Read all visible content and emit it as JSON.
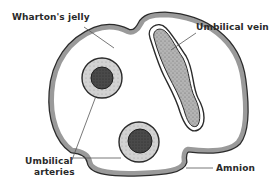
{
  "diagram": {
    "labels": {
      "whartons_jelly": "Wharton's jelly",
      "umbilical_vein": "Umbilical vein",
      "umbilical_arteries_line1": "Umbilical",
      "umbilical_arteries_line2": "arteries",
      "amnion": "Amnion"
    },
    "structures": [
      {
        "name": "Amnion",
        "role": "outer membrane"
      },
      {
        "name": "Wharton's jelly",
        "role": "connective tissue filling"
      },
      {
        "name": "Umbilical vein",
        "count": 1
      },
      {
        "name": "Umbilical arteries",
        "count": 2
      }
    ],
    "colors": {
      "membrane_fill": "#9a9a9a",
      "membrane_stroke": "#2b2b2b",
      "artery_wall": "#c8c8c8",
      "artery_lumen": "#4a4a4a",
      "vein_fill": "#a8a8a8",
      "leader_line": "#555555"
    }
  }
}
